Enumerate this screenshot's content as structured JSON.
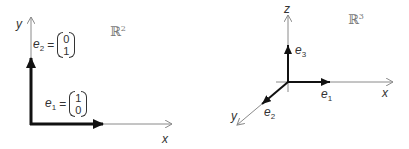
{
  "figure": {
    "panels": [
      {
        "id": "r2",
        "space_label": "ℝ",
        "space_dim": "2",
        "axes": {
          "x": "x",
          "y": "y"
        },
        "vectors": [
          {
            "name": "e",
            "index": "1",
            "components": [
              "1",
              "0"
            ]
          },
          {
            "name": "e",
            "index": "2",
            "components": [
              "0",
              "1"
            ]
          }
        ]
      },
      {
        "id": "r3",
        "space_label": "ℝ",
        "space_dim": "3",
        "axes": {
          "x": "x",
          "y": "y",
          "z": "z"
        },
        "vectors": [
          {
            "name": "e",
            "index": "1"
          },
          {
            "name": "e",
            "index": "2"
          },
          {
            "name": "e",
            "index": "3"
          }
        ]
      }
    ],
    "equals_sign": "=",
    "colors": {
      "axis": "#8a8a8a",
      "vector": "#111111",
      "text": "#333333"
    }
  }
}
